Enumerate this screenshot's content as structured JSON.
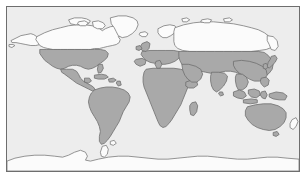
{
  "map": {
    "title": "World Map",
    "projection": "equirectangular",
    "frame": {
      "border_color": "#6e6e6e",
      "background_color": "#eeeeee"
    },
    "legend": {
      "shaded_label": "Highlighted region",
      "shaded_color": "#a9a9a9",
      "unshaded_label": "Unhighlighted region",
      "unshaded_color": "#fbfbfb",
      "ocean_label": "Ocean",
      "ocean_color": "#ededed",
      "outline_color": "#7a7a7a"
    },
    "regions": [
      {
        "id": "greenland",
        "name": "Greenland",
        "shaded": false
      },
      {
        "id": "canada-arctic",
        "name": "Canada and Arctic Islands",
        "shaded": false
      },
      {
        "id": "alaska",
        "name": "Alaska",
        "shaded": false
      },
      {
        "id": "united-states",
        "name": "United States",
        "shaded": true
      },
      {
        "id": "mexico-central-america",
        "name": "Mexico and Central America",
        "shaded": true
      },
      {
        "id": "caribbean",
        "name": "Caribbean Islands",
        "shaded": true
      },
      {
        "id": "south-america",
        "name": "South America",
        "shaded": true
      },
      {
        "id": "africa",
        "name": "Africa",
        "shaded": true
      },
      {
        "id": "madagascar",
        "name": "Madagascar",
        "shaded": true
      },
      {
        "id": "scandinavia",
        "name": "Scandinavia",
        "shaded": false
      },
      {
        "id": "europe",
        "name": "Europe",
        "shaded": true
      },
      {
        "id": "british-isles",
        "name": "British Isles",
        "shaded": true
      },
      {
        "id": "northern-russia",
        "name": "Northern Russia and Siberia",
        "shaded": false
      },
      {
        "id": "central-southern-asia",
        "name": "Central and Southern Asia",
        "shaded": true
      },
      {
        "id": "middle-east",
        "name": "Middle East",
        "shaded": true
      },
      {
        "id": "india",
        "name": "India",
        "shaded": true
      },
      {
        "id": "china-east-asia",
        "name": "China and East Asia",
        "shaded": true
      },
      {
        "id": "japan",
        "name": "Japan",
        "shaded": true
      },
      {
        "id": "southeast-asia",
        "name": "Southeast Asia and Indonesia",
        "shaded": true
      },
      {
        "id": "philippines",
        "name": "Philippines",
        "shaded": true
      },
      {
        "id": "new-guinea",
        "name": "New Guinea",
        "shaded": true
      },
      {
        "id": "australia",
        "name": "Australia",
        "shaded": true
      },
      {
        "id": "new-zealand",
        "name": "New Zealand",
        "shaded": false
      },
      {
        "id": "antarctica",
        "name": "Antarctica",
        "shaded": false
      },
      {
        "id": "iceland",
        "name": "Iceland",
        "shaded": false
      },
      {
        "id": "sri-lanka",
        "name": "Sri Lanka",
        "shaded": true
      }
    ]
  }
}
